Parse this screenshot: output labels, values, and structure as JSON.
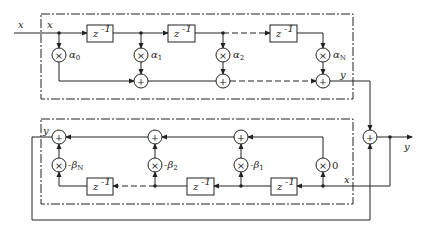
{
  "colors": {
    "ink": "#222222",
    "background": "#ffffff"
  },
  "labels": {
    "input_x": "x",
    "top_x": "x",
    "top_y": "y",
    "bottom_y": "y",
    "bottom_x": "x",
    "output_y": "y",
    "delay": "z",
    "delay_exp": "-1",
    "mult_symbol": "×",
    "add_symbol": "+"
  },
  "top_block": {
    "coefficients": [
      {
        "name": "α",
        "sub": "0"
      },
      {
        "name": "α",
        "sub": "1"
      },
      {
        "name": "α",
        "sub": "2"
      },
      {
        "name": "α",
        "sub": "N"
      }
    ]
  },
  "bottom_block": {
    "coefficients": [
      {
        "name": "-β",
        "sub": "N"
      },
      {
        "name": "-β",
        "sub": "2"
      },
      {
        "name": "-β",
        "sub": "1"
      },
      {
        "name": "0",
        "sub": ""
      }
    ]
  }
}
